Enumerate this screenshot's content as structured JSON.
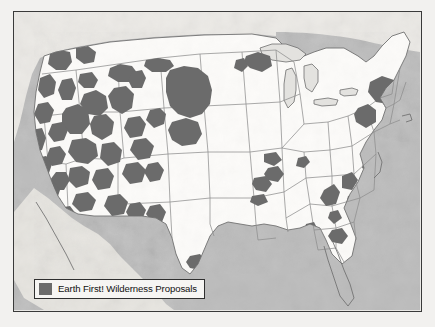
{
  "figure": {
    "type": "thematic-map",
    "subject": "Earth First! Wilderness Proposals",
    "region": "Contiguous United States",
    "title": ""
  },
  "legend": {
    "label": "Earth First! Wilderness Proposals",
    "swatch_color": "#6b6b6b",
    "position": "bottom-left"
  },
  "colors": {
    "proposal_fill": "#6b6b6b",
    "land_fill": "#fbfaf8",
    "ocean_fill": "#b9b9b9",
    "state_border": "#8a8a8a",
    "coast_border": "#6f6f6f",
    "frame_border": "#3a3a3a",
    "page_background": "#f2f1ef",
    "terrain_shade": "#d9d8d4",
    "legend_background": "#f6f5f3",
    "legend_text": "#111111"
  },
  "map": {
    "frame": {
      "x": 13,
      "y": 11,
      "width": 409,
      "height": 301
    },
    "ocean_regions": [
      {
        "name": "pacific-ocean",
        "side": "west"
      },
      {
        "name": "atlantic-ocean",
        "side": "east"
      },
      {
        "name": "gulf-of-mexico",
        "side": "south"
      },
      {
        "name": "great-lakes",
        "side": "north-central"
      }
    ],
    "proposal_area_count": 64,
    "density_note": "Highest concentration in the Intermountain West (Nevada, Utah, Idaho, Oregon, California); scattered isolated areas in the East and South."
  }
}
